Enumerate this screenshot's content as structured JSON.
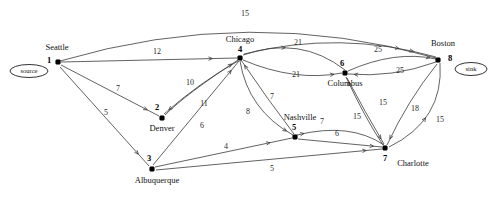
{
  "diagram": {
    "background_color": "#ffffff",
    "line_color": "#3a3a3a",
    "node_color": "#000000"
  },
  "terminals": [
    {
      "id": "source",
      "label": "source",
      "cx": 29,
      "cy": 71,
      "rx": 19,
      "ry": 6.5
    },
    {
      "id": "sink",
      "label": "sink",
      "cx": 471,
      "cy": 69,
      "rx": 16,
      "ry": 6.5
    }
  ],
  "nodes": [
    {
      "id": "n1",
      "number": "1",
      "city": "Seattle",
      "x": 58,
      "y": 62,
      "num_dx": -9,
      "num_dy": 1,
      "city_dx": -1,
      "city_dy": -12,
      "city_anchor": "middle"
    },
    {
      "id": "n2",
      "number": "2",
      "city": "Denver",
      "x": 162,
      "y": 118,
      "num_dx": -5,
      "num_dy": -8,
      "city_dx": 0,
      "city_dy": 13,
      "city_anchor": "middle"
    },
    {
      "id": "n3",
      "number": "3",
      "city": "Albuquerque",
      "x": 152,
      "y": 169,
      "num_dx": -3,
      "num_dy": -8,
      "city_dx": 5,
      "city_dy": 14,
      "city_anchor": "middle"
    },
    {
      "id": "n4",
      "number": "4",
      "city": "Chicago",
      "x": 240,
      "y": 58,
      "num_dx": 0,
      "num_dy": -6,
      "city_dx": 0,
      "city_dy": -16,
      "city_anchor": "middle"
    },
    {
      "id": "n5",
      "number": "5",
      "city": "Nashville",
      "x": 295,
      "y": 137,
      "num_dx": -1,
      "num_dy": -7,
      "city_dx": 5,
      "city_dy": -17,
      "city_anchor": "middle"
    },
    {
      "id": "n6",
      "number": "6",
      "city": "Columbus",
      "x": 345,
      "y": 73,
      "num_dx": -3,
      "num_dy": -7,
      "city_dx": 0,
      "city_dy": 13,
      "city_anchor": "middle"
    },
    {
      "id": "n7",
      "number": "7",
      "city": "Charlotte",
      "x": 385,
      "y": 148,
      "num_dx": 0,
      "num_dy": 13,
      "city_dx": 28,
      "city_dy": 18,
      "city_anchor": "middle"
    },
    {
      "id": "n8",
      "number": "8",
      "city": "Boston",
      "x": 438,
      "y": 60,
      "num_dx": 12,
      "num_dy": 1,
      "city_dx": 5,
      "city_dy": -14,
      "city_anchor": "middle"
    }
  ],
  "edges": [
    {
      "id": "e-1-8",
      "from": "1",
      "to": "8",
      "weight": "15",
      "path": "M 60 61 Q 250 5 436 58",
      "label_x": 245,
      "label_y": 16,
      "arrow_at": 0.9
    },
    {
      "id": "e-1-4",
      "from": "1",
      "to": "4",
      "weight": "12",
      "path": "M 61 62 L 237 58",
      "label_x": 157,
      "label_y": 54,
      "arrow_at": 0.86
    },
    {
      "id": "e-1-2",
      "from": "1",
      "to": "2",
      "weight": "7",
      "path": "M 61 65 L 159 116",
      "label_x": 118,
      "label_y": 91,
      "arrow_at": 0.88
    },
    {
      "id": "e-1-3",
      "from": "1",
      "to": "3",
      "weight": "5",
      "path": "M 60 67 L 149 166",
      "label_x": 106,
      "label_y": 115,
      "arrow_at": 0.88
    },
    {
      "id": "e-2-4",
      "from": "2",
      "to": "4",
      "weight": "10",
      "path": "M 165 115 Q 186 94 238 60",
      "label_x": 190,
      "label_y": 85,
      "arrow_at": 0.92
    },
    {
      "id": "e-4-2",
      "from": "4",
      "to": "2",
      "weight": "11",
      "path": "M 238 61 Q 199 83 164 114",
      "label_x": 204,
      "label_y": 106,
      "arrow_at": 0.93
    },
    {
      "id": "e-3-4",
      "from": "3",
      "to": "4",
      "weight": "6",
      "path": "M 153 165 L 239 61",
      "label_x": 202,
      "label_y": 128,
      "arrow_at": 0.91
    },
    {
      "id": "e-4-5",
      "from": "4",
      "to": "5",
      "weight": "8",
      "path": "M 240 61 Q 248 110 293 135",
      "label_x": 248,
      "label_y": 114,
      "arrow_at": 0.92
    },
    {
      "id": "e-5-4",
      "from": "5",
      "to": "4",
      "weight": "7",
      "path": "M 294 134 Q 268 100 241 60",
      "label_x": 272,
      "label_y": 99,
      "arrow_at": 0.93
    },
    {
      "id": "e-4-6a",
      "from": "4",
      "to": "6",
      "weight": "21",
      "path": "M 243 55 Q 300 35 345 70",
      "label_x": 298,
      "label_y": 45,
      "arrow_at": 0.4
    },
    {
      "id": "e-4-6b",
      "from": "4",
      "to": "6",
      "weight": "21",
      "path": "M 243 60 Q 295 82 342 73",
      "label_x": 296,
      "label_y": 77,
      "arrow_at": 0.92
    },
    {
      "id": "e-6-8a",
      "from": "6",
      "to": "8",
      "weight": "25",
      "path": "M 348 71 Q 395 50 436 59",
      "label_x": 378,
      "label_y": 52,
      "arrow_at": 0.93
    },
    {
      "id": "e-8-6",
      "from": "8",
      "to": "6",
      "weight": "25",
      "path": "M 436 62 Q 392 78 348 74",
      "label_x": 400,
      "label_y": 73,
      "arrow_at": 0.93
    },
    {
      "id": "e-4-8",
      "from": "4",
      "to": "8",
      "weight": "25",
      "path": "M 244 54 Q 340 30 436 57",
      "label_x": 378,
      "label_y": 52,
      "arrow_at": 0.88,
      "hidden_label": true
    },
    {
      "id": "e-5-7",
      "from": "5",
      "to": "7",
      "weight": "7",
      "path": "M 297 135 Q 350 122 384 145",
      "label_x": 322,
      "label_y": 124,
      "arrow_at": 0.08
    },
    {
      "id": "e-5-7b",
      "from": "5",
      "to": "7",
      "weight": "6",
      "path": "M 298 139 L 382 147",
      "label_x": 337,
      "label_y": 136,
      "arrow_at": 0.9
    },
    {
      "id": "e-3-5",
      "from": "3",
      "to": "5",
      "weight": "4",
      "path": "M 155 167 L 292 138",
      "label_x": 226,
      "label_y": 149,
      "arrow_at": 0.84
    },
    {
      "id": "e-3-7",
      "from": "3",
      "to": "7",
      "weight": "5",
      "path": "M 156 170 L 382 149",
      "label_x": 272,
      "label_y": 171,
      "arrow_at": 0.93
    },
    {
      "id": "e-7-6",
      "from": "7",
      "to": "6",
      "weight": "15",
      "path": "M 383 145 Q 365 118 346 77",
      "label_x": 357,
      "label_y": 119,
      "arrow_at": 0.93
    },
    {
      "id": "e-6-7",
      "from": "6",
      "to": "7",
      "weight": "15",
      "path": "M 347 78 Q 365 112 384 144",
      "label_x": 383,
      "label_y": 105,
      "arrow_at": 0.92
    },
    {
      "id": "e-8-7",
      "from": "8",
      "to": "7",
      "weight": "18",
      "path": "M 437 64 Q 408 100 387 145",
      "label_x": 415,
      "label_y": 111,
      "arrow_at": 0.93
    },
    {
      "id": "e-7-8",
      "from": "7",
      "to": "8",
      "weight": "15",
      "path": "M 389 147 Q 444 120 440 63",
      "label_x": 440,
      "label_y": 122,
      "arrow_at": 0.45
    }
  ]
}
